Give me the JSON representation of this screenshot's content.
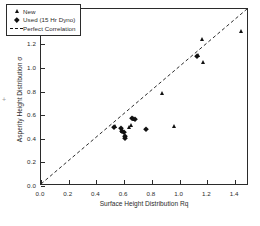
{
  "chart_data": {
    "type": "scatter",
    "title": "",
    "xlabel": "Surface Height Distribution Rq",
    "ylabel": "Asperity Height Distribution σ",
    "xlim": [
      0.0,
      1.5
    ],
    "ylim": [
      0.0,
      1.5
    ],
    "xticks": [
      "0.0",
      "0.2",
      "0.4",
      "0.6",
      "0.8",
      "1.0",
      "1.2",
      "1.4"
    ],
    "xtick_values": [
      0.0,
      0.2,
      0.4,
      0.6,
      0.8,
      1.0,
      1.2,
      1.4
    ],
    "yticks": [
      "0.0",
      "0.2",
      "0.4",
      "0.6",
      "0.8",
      "1.0",
      "1.2",
      "1.4"
    ],
    "ytick_values": [
      0.0,
      0.2,
      0.4,
      0.6,
      0.8,
      1.0,
      1.2,
      1.4
    ],
    "grid": false,
    "legend_position": "upper-left",
    "series": [
      {
        "name": "New",
        "marker": "triangle",
        "color": "#111111",
        "points": [
          [
            0.535,
            0.505
          ],
          [
            0.585,
            0.47
          ],
          [
            0.605,
            0.415
          ],
          [
            0.635,
            0.5
          ],
          [
            0.65,
            0.52
          ],
          [
            0.66,
            0.575
          ],
          [
            0.67,
            0.565
          ],
          [
            0.875,
            0.79
          ],
          [
            0.96,
            0.505
          ],
          [
            1.13,
            1.11
          ],
          [
            1.16,
            1.25
          ],
          [
            1.165,
            1.05
          ],
          [
            1.445,
            1.315
          ]
        ]
      },
      {
        "name": "Used (15 Hr Dyno)",
        "marker": "diamond",
        "color": "#111111",
        "points": [
          [
            0.53,
            0.5
          ],
          [
            0.575,
            0.495
          ],
          [
            0.585,
            0.465
          ],
          [
            0.6,
            0.455
          ],
          [
            0.605,
            0.425
          ],
          [
            0.608,
            0.41
          ],
          [
            0.655,
            0.58
          ],
          [
            0.68,
            0.565
          ],
          [
            0.76,
            0.48
          ],
          [
            1.125,
            1.105
          ]
        ]
      }
    ],
    "reference_line": {
      "name": "Perfect Correlation",
      "style": "dashed",
      "color": "#111111",
      "from": [
        0.0,
        0.0
      ],
      "to": [
        1.5,
        1.5
      ]
    }
  },
  "legend": {
    "items": [
      {
        "label": "New",
        "marker": "triangle-marker"
      },
      {
        "label": "Used (15 Hr Dyno)",
        "marker": "diamond-marker"
      },
      {
        "label": "Perfect Correlation",
        "marker": "dashed-line-marker"
      }
    ]
  },
  "stray": {
    "mark": "+"
  }
}
